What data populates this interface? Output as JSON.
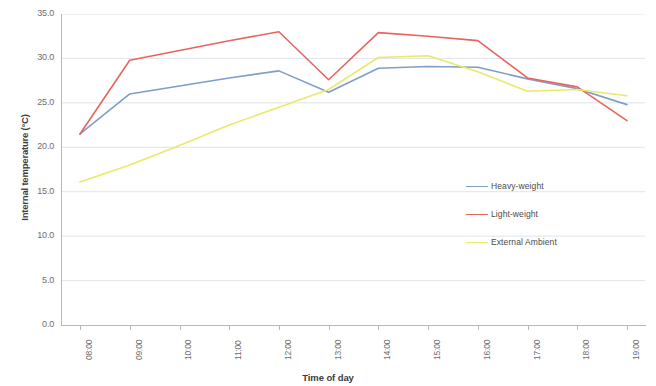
{
  "chart_data": {
    "type": "line",
    "title": "",
    "xlabel": "Time of day",
    "ylabel": "Internal temperature (°C)",
    "categories": [
      "08:00",
      "09:00",
      "10:00",
      "11:00",
      "12:00",
      "13:00",
      "14:00",
      "15:00",
      "16:00",
      "17:00",
      "18:00",
      "19:00"
    ],
    "x": [
      "08:00",
      "09:00",
      "10:00",
      "11:00",
      "12:00",
      "13:00",
      "14:00",
      "15:00",
      "16:00",
      "17:00",
      "18:00",
      "19:00"
    ],
    "ylim": [
      0.0,
      35.0
    ],
    "ytick_labels": [
      "35.0",
      "30.0",
      "25.0",
      "20.0",
      "15.0",
      "10.0",
      "5.0",
      "0.0"
    ],
    "ytick_values": [
      35.0,
      30.0,
      25.0,
      20.0,
      15.0,
      10.0,
      5.0,
      0.0
    ],
    "ytick_step": 5.0,
    "grid": true,
    "grid_axis": "y",
    "legend_position": "center-right",
    "series": [
      {
        "name": "Heavy-weight",
        "color": "#7e9ec9",
        "values": [
          21.5,
          26.0,
          26.9,
          27.8,
          28.6,
          26.2,
          28.9,
          29.1,
          29.0,
          27.7,
          26.6,
          24.8
        ]
      },
      {
        "name": "Light-weight",
        "color": "#e8645f",
        "values": [
          21.5,
          29.8,
          30.9,
          32.0,
          33.0,
          27.6,
          32.9,
          32.5,
          32.0,
          27.8,
          26.8,
          23.0
        ]
      },
      {
        "name": "External Ambient",
        "color": "#e9e96a",
        "values": [
          16.1,
          18.0,
          20.2,
          22.5,
          24.5,
          26.5,
          30.1,
          30.3,
          28.5,
          26.3,
          26.5,
          25.8
        ]
      }
    ]
  },
  "axes": {
    "y_title": "Internal temperature (°C)",
    "x_title": "Time of day"
  },
  "legend": {
    "items": [
      {
        "label": "Heavy-weight",
        "color": "#7e9ec9"
      },
      {
        "label": "Light-weight",
        "color": "#e8645f"
      },
      {
        "label": "External Ambient",
        "color": "#e9e96a"
      }
    ]
  },
  "colors": {
    "heavy_weight": "#7e9ec9",
    "light_weight": "#e8645f",
    "external_ambient": "#e9e96a",
    "grid": "#d9dce3",
    "axis": "#b8b8b8",
    "tick_text": "#6e6e6e",
    "title_text": "#3c3c3c",
    "background": "#ffffff"
  }
}
